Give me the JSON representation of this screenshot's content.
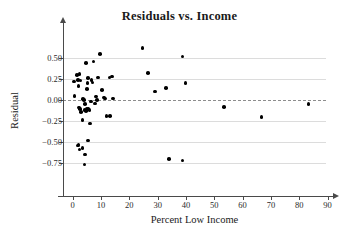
{
  "chart_data": {
    "type": "scatter",
    "title": "Residuals vs. Income",
    "xlabel": "Percent Low Income",
    "ylabel": "Residual",
    "xlim": [
      -5,
      95
    ],
    "ylim": [
      -0.86,
      0.72
    ],
    "xticks": [
      0,
      10,
      20,
      30,
      40,
      50,
      60,
      70,
      80,
      90
    ],
    "xticklabels": [
      "0",
      "10",
      "20",
      "30",
      "40",
      "50",
      "60",
      "70",
      "80",
      "90"
    ],
    "yticks": [
      0.5,
      0.25,
      0.0,
      -0.25,
      -0.5,
      -0.75
    ],
    "yticklabels": [
      "0.50",
      "0.25",
      "0.00",
      "−0.25",
      "−0.50",
      "−0.75"
    ],
    "grid": "horizontal",
    "reference_line": {
      "y": 0.0,
      "style": "dashed"
    },
    "marker_color": "#000000",
    "grid_color": "#dcdcdc",
    "axis_color": "#4a4a4a",
    "legend": null,
    "points": [
      {
        "x": 0.4,
        "y": 0.22
      },
      {
        "x": 0.6,
        "y": 0.05
      },
      {
        "x": 1.6,
        "y": 0.3
      },
      {
        "x": 2.4,
        "y": 0.31
      },
      {
        "x": 1.9,
        "y": 0.24
      },
      {
        "x": 2.8,
        "y": 0.23
      },
      {
        "x": 2.0,
        "y": 0.17
      },
      {
        "x": 2.2,
        "y": -0.09
      },
      {
        "x": 2.6,
        "y": -0.11
      },
      {
        "x": 3.0,
        "y": -0.14
      },
      {
        "x": 3.4,
        "y": -0.24
      },
      {
        "x": 3.6,
        "y": 0.01
      },
      {
        "x": 4.0,
        "y": 0.0
      },
      {
        "x": 4.4,
        "y": -0.05
      },
      {
        "x": 4.2,
        "y": -0.12
      },
      {
        "x": 4.6,
        "y": -0.13
      },
      {
        "x": 5.0,
        "y": 0.13
      },
      {
        "x": 5.2,
        "y": 0.2
      },
      {
        "x": 5.4,
        "y": 0.26
      },
      {
        "x": 4.8,
        "y": 0.44
      },
      {
        "x": 5.0,
        "y": -0.11
      },
      {
        "x": 5.6,
        "y": -0.1
      },
      {
        "x": 6.0,
        "y": -0.12
      },
      {
        "x": 6.4,
        "y": -0.02
      },
      {
        "x": 6.2,
        "y": -0.28
      },
      {
        "x": 6.6,
        "y": 0.24
      },
      {
        "x": 7.0,
        "y": 0.21
      },
      {
        "x": 7.4,
        "y": 0.46
      },
      {
        "x": 7.8,
        "y": -0.04
      },
      {
        "x": 8.2,
        "y": 0.04
      },
      {
        "x": 8.6,
        "y": 0.0
      },
      {
        "x": 9.0,
        "y": 0.27
      },
      {
        "x": 9.6,
        "y": 0.55
      },
      {
        "x": 10.4,
        "y": 0.12
      },
      {
        "x": 11.0,
        "y": 0.03
      },
      {
        "x": 11.4,
        "y": 0.02
      },
      {
        "x": 12.0,
        "y": -0.19
      },
      {
        "x": 13.2,
        "y": -0.19
      },
      {
        "x": 13.0,
        "y": 0.27
      },
      {
        "x": 13.8,
        "y": 0.28
      },
      {
        "x": 14.2,
        "y": 0.02
      },
      {
        "x": 2.0,
        "y": -0.53
      },
      {
        "x": 1.8,
        "y": -0.54
      },
      {
        "x": 2.4,
        "y": -0.59
      },
      {
        "x": 3.4,
        "y": -0.57
      },
      {
        "x": 4.4,
        "y": -0.65
      },
      {
        "x": 5.4,
        "y": -0.48
      },
      {
        "x": 4.2,
        "y": -0.77
      },
      {
        "x": 24.6,
        "y": 0.62
      },
      {
        "x": 26.6,
        "y": 0.32
      },
      {
        "x": 29.0,
        "y": 0.1
      },
      {
        "x": 33.0,
        "y": 0.14
      },
      {
        "x": 38.7,
        "y": 0.52
      },
      {
        "x": 39.9,
        "y": 0.2
      },
      {
        "x": 33.9,
        "y": -0.7
      },
      {
        "x": 38.7,
        "y": -0.72
      },
      {
        "x": 53.4,
        "y": -0.08
      },
      {
        "x": 66.6,
        "y": -0.2
      },
      {
        "x": 83.2,
        "y": -0.05
      }
    ]
  }
}
